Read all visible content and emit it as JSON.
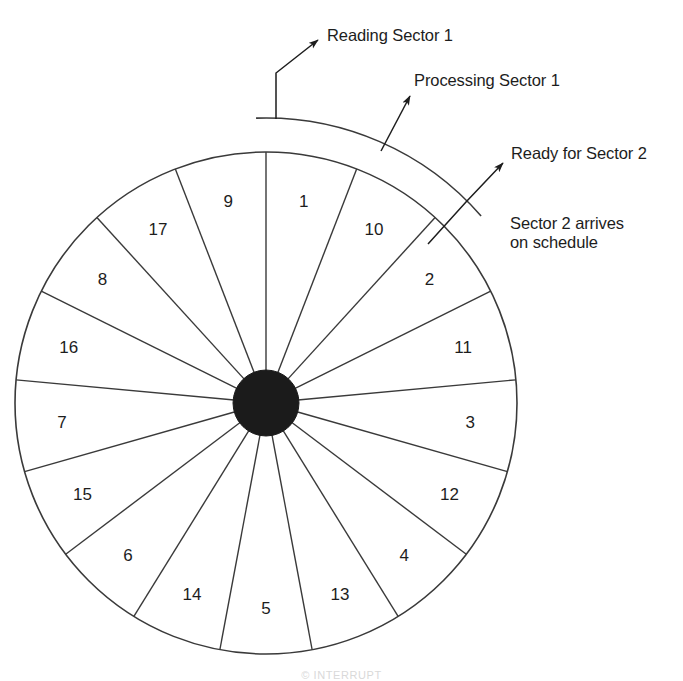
{
  "figure": {
    "title_caption": "© INTERRUPT",
    "disk": {
      "description": "disk platter divided into numbered sectors with a dark central hub",
      "sector_count": 17,
      "sector_labels_clockwise_from_top": [
        "1",
        "10",
        "2",
        "11",
        "3",
        "12",
        "4",
        "13",
        "5",
        "14",
        "6",
        "15",
        "7",
        "16",
        "8",
        "17",
        "9"
      ],
      "center_x": 266,
      "center_y": 403,
      "outer_radius": 251,
      "hub_radius": 33,
      "label_radius": 205,
      "start_angle_deg": -90,
      "hub_color": "#1b1b1b",
      "line_color": "#3a3a3a"
    },
    "arc_band": {
      "description": "outer concentric arc spanning the sectors being read",
      "radius": 285,
      "start_angle_deg": -92,
      "end_angle_deg": -41
    },
    "annotations": [
      {
        "id": "reading",
        "text": "Reading Sector 1",
        "leader": "elbow from arc start upward then arrow up-right"
      },
      {
        "id": "processing",
        "text": "Processing Sector 1",
        "leader": "straight arrow up-right from arc"
      },
      {
        "id": "ready",
        "text": "Ready for Sector 2",
        "leader": "elbow from arc end then arrow up-right"
      },
      {
        "id": "arrives",
        "text": "Sector 2 arrives\non schedule",
        "leader": "none"
      }
    ]
  }
}
